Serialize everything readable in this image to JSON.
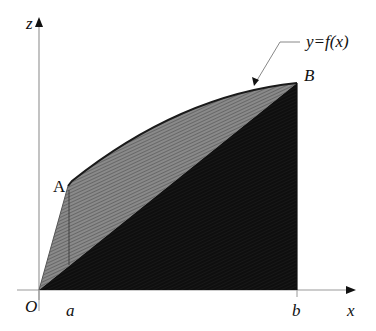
{
  "diagram": {
    "axes": {
      "vertical_label": "z",
      "horizontal_label": "x",
      "origin_label": "O"
    },
    "points": {
      "A": "A",
      "B": "B"
    },
    "ticks": {
      "a": "a",
      "b": "b"
    },
    "curve_label": "y=f(x)",
    "colors": {
      "axis": "#9a9a9a",
      "upper_region_fill": "#7a7a7a",
      "lower_region_fill": "#111111",
      "outline": "#1a1a1a"
    }
  }
}
